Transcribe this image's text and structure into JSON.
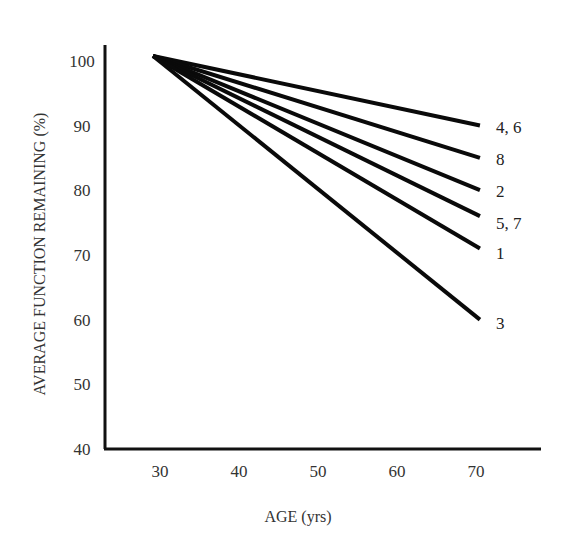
{
  "chart_data": {
    "type": "line",
    "title": "",
    "xlabel": "AGE (yrs)",
    "ylabel": "AVERAGE FUNCTION REMAINING (%)",
    "xlim": [
      23,
      79
    ],
    "ylim": [
      40,
      102
    ],
    "x_ticks": [
      30,
      40,
      50,
      60,
      70
    ],
    "y_ticks": [
      40,
      50,
      60,
      70,
      80,
      90,
      100
    ],
    "grid": false,
    "legend_position": "inline-right-end-labels",
    "series": [
      {
        "name": "4, 6",
        "x": [
          29.5,
          70.5
        ],
        "values": [
          101,
          90
        ]
      },
      {
        "name": "8",
        "x": [
          29.5,
          70.5
        ],
        "values": [
          101,
          85
        ]
      },
      {
        "name": "2",
        "x": [
          29.5,
          70.5
        ],
        "values": [
          101,
          80
        ]
      },
      {
        "name": "5, 7",
        "x": [
          29.5,
          70.5
        ],
        "values": [
          101,
          76
        ]
      },
      {
        "name": "1",
        "x": [
          29.5,
          70.5
        ],
        "values": [
          101,
          71
        ]
      },
      {
        "name": "3",
        "x": [
          29.5,
          70.5
        ],
        "values": [
          101,
          60
        ]
      }
    ]
  }
}
